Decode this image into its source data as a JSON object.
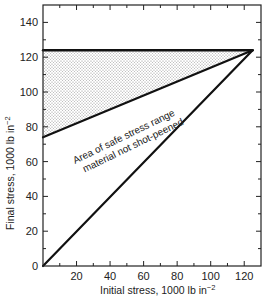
{
  "chart_data": {
    "type": "line",
    "title": "",
    "xlabel": "Initial stress, 1000 lb in",
    "xlabel_sup": "−2",
    "ylabel": "Final stress, 1000 lb in",
    "ylabel_sup": "−2",
    "xlim": [
      0,
      130
    ],
    "ylim": [
      0,
      150
    ],
    "x_ticks": [
      20,
      40,
      60,
      80,
      100,
      120
    ],
    "x_minor_step": 10,
    "y_ticks": [
      0,
      20,
      40,
      60,
      80,
      100,
      120,
      140
    ],
    "y_minor_step": 10,
    "grid": false,
    "series": [
      {
        "name": "Initial = Final diagonal",
        "x": [
          0,
          125
        ],
        "y": [
          0,
          124
        ]
      },
      {
        "name": "Lower bound of safe range",
        "x": [
          0,
          125
        ],
        "y": [
          74,
          124
        ]
      },
      {
        "name": "Upper bound (ultimate stress)",
        "x": [
          0,
          125
        ],
        "y": [
          124,
          124
        ]
      }
    ],
    "shaded_region": {
      "description": "Stippled area between lower bound and upper bound",
      "vertices": [
        [
          0,
          74
        ],
        [
          0,
          124
        ],
        [
          125,
          124
        ]
      ]
    },
    "annotations": [
      {
        "text_line1": "Area of safe stress range",
        "text_line2": "material not shot-peened",
        "x": 20,
        "y": 55,
        "rotation": -26
      }
    ]
  },
  "labels": {
    "annotation_line1": "Area of safe stress range",
    "annotation_line2": "material not shot-peened",
    "xlabel": "Initial stress, 1000 lb in",
    "ylabel": "Final stress, 1000 lb in",
    "sup": "−2"
  },
  "colors": {
    "line": "#111111",
    "stipple": "#9a9a9a",
    "frame": "#222222"
  }
}
